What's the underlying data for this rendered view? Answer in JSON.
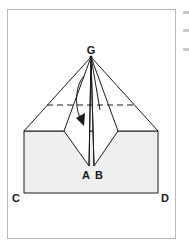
{
  "figure": {
    "labels": {
      "apex": "G",
      "center_left": "A",
      "center_right": "B",
      "bottom_left": "C",
      "bottom_right": "D"
    },
    "colors": {
      "line": "#1a1a1a",
      "shade": "#eeeeee",
      "frame": "#b8b8b8"
    },
    "annotations": {
      "dashed_fold_line": "horizontal valley fold",
      "arrow": "fold direction arrow"
    }
  }
}
